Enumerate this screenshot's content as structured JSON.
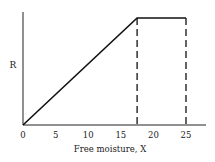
{
  "chart_data": {
    "type": "line",
    "title": "",
    "xlabel": "Free moisture, X",
    "ylabel": "R",
    "x_ticks": [
      "0",
      "5",
      "10",
      "15",
      "20",
      "25"
    ],
    "xlim": [
      0,
      28
    ],
    "series": [
      {
        "name": "drying rate",
        "x": [
          0,
          17.5,
          25
        ],
        "y": [
          0,
          1,
          1
        ]
      }
    ],
    "dashed_verticals": [
      17.5,
      25
    ],
    "grid": false,
    "legend": null
  }
}
